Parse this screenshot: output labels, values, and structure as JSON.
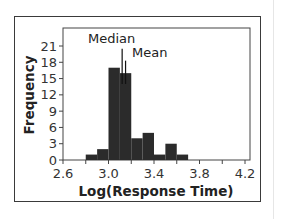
{
  "chart_data": {
    "type": "bar",
    "subtype": "histogram",
    "title": "",
    "xlabel": "Log(Response Time)",
    "ylabel": "Frequency",
    "xlim": [
      2.6,
      4.2
    ],
    "ylim": [
      0,
      21
    ],
    "x_ticks": [
      "2.6",
      "3.0",
      "3.4",
      "3.8",
      "4.2"
    ],
    "y_ticks": [
      "0",
      "3",
      "6",
      "9",
      "12",
      "15",
      "18",
      "21"
    ],
    "bin_width": 0.1,
    "bins": [
      {
        "start": 2.8,
        "end": 2.9,
        "count": 1
      },
      {
        "start": 2.9,
        "end": 3.0,
        "count": 2
      },
      {
        "start": 3.0,
        "end": 3.1,
        "count": 17
      },
      {
        "start": 3.1,
        "end": 3.2,
        "count": 16
      },
      {
        "start": 3.2,
        "end": 3.3,
        "count": 4
      },
      {
        "start": 3.3,
        "end": 3.4,
        "count": 5
      },
      {
        "start": 3.4,
        "end": 3.5,
        "count": 1
      },
      {
        "start": 3.5,
        "end": 3.6,
        "count": 3
      },
      {
        "start": 3.6,
        "end": 3.7,
        "count": 1
      }
    ],
    "categories": [
      "2.8-2.9",
      "2.9-3.0",
      "3.0-3.1",
      "3.1-3.2",
      "3.2-3.3",
      "3.3-3.4",
      "3.4-3.5",
      "3.5-3.6",
      "3.6-3.7"
    ],
    "values": [
      1,
      2,
      17,
      16,
      4,
      5,
      1,
      3,
      1
    ],
    "annotations": [
      {
        "label": "Median",
        "x": 3.12,
        "line_top": 20.5
      },
      {
        "label": "Mean",
        "x": 3.15,
        "line_top": 18.3
      }
    ],
    "grid": false,
    "legend": "none",
    "bar_color": "#2b2b2b"
  }
}
